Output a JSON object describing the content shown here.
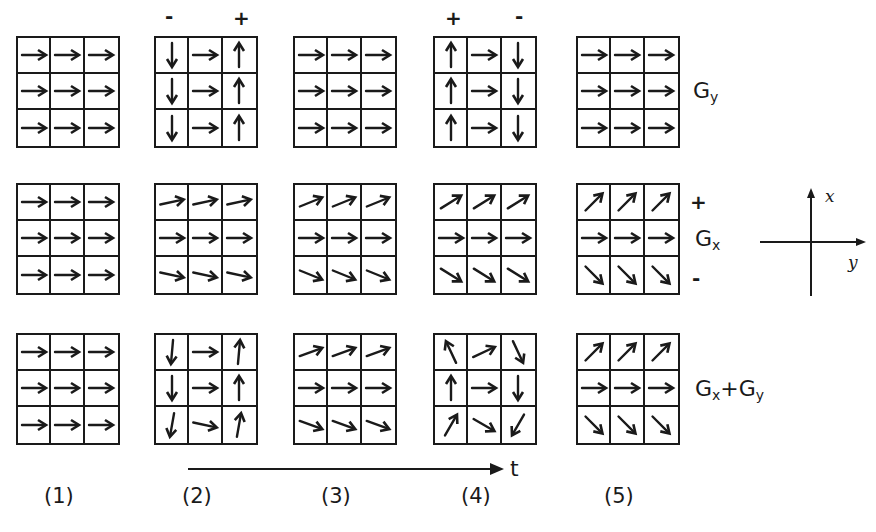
{
  "figure": {
    "columns": [
      {
        "id": 1,
        "label": "(1)",
        "x": 16
      },
      {
        "id": 2,
        "label": "(2)",
        "x": 154
      },
      {
        "id": 3,
        "label": "(3)",
        "x": 293
      },
      {
        "id": 4,
        "label": "(4)",
        "x": 433
      },
      {
        "id": 5,
        "label": "(5)",
        "x": 576
      }
    ],
    "rows": [
      {
        "name": "Gy",
        "label_main": "G",
        "label_sub": "y",
        "y": 36,
        "grids": [
          [
            0,
            0,
            0,
            0,
            0,
            0,
            0,
            0,
            0
          ],
          [
            -90,
            0,
            90,
            -90,
            0,
            90,
            -90,
            0,
            90
          ],
          [
            0,
            0,
            0,
            0,
            0,
            0,
            0,
            0,
            0
          ],
          [
            90,
            0,
            -90,
            90,
            0,
            -90,
            90,
            0,
            -90
          ],
          [
            0,
            0,
            0,
            0,
            0,
            0,
            0,
            0,
            0
          ]
        ]
      },
      {
        "name": "Gx",
        "label_main": "G",
        "label_sub": "x",
        "y": 183,
        "plus_sign": "+",
        "minus_sign": "-",
        "grids": [
          [
            0,
            0,
            0,
            0,
            0,
            0,
            0,
            0,
            0
          ],
          [
            12,
            12,
            12,
            0,
            0,
            0,
            -12,
            -12,
            -12
          ],
          [
            22,
            22,
            22,
            0,
            0,
            0,
            -22,
            -22,
            -22
          ],
          [
            32,
            32,
            32,
            0,
            0,
            0,
            -32,
            -32,
            -32
          ],
          [
            45,
            45,
            45,
            0,
            0,
            0,
            -45,
            -45,
            -45
          ]
        ]
      },
      {
        "name": "Gx+Gy",
        "label_main": "G",
        "label_sub": "x",
        "label_plus": "+",
        "label_main2": "G",
        "label_sub2": "y",
        "y": 333,
        "grids": [
          [
            0,
            0,
            0,
            0,
            0,
            0,
            0,
            0,
            0
          ],
          [
            -95,
            0,
            85,
            -90,
            0,
            90,
            -100,
            -12,
            80
          ],
          [
            20,
            20,
            20,
            0,
            0,
            0,
            -20,
            -20,
            -20
          ],
          [
            115,
            25,
            -65,
            90,
            0,
            -90,
            60,
            -30,
            -120
          ],
          [
            45,
            45,
            45,
            0,
            0,
            0,
            -45,
            -45,
            -45
          ]
        ]
      }
    ],
    "top_signs": [
      {
        "column": 2,
        "left": "-",
        "right": "+"
      },
      {
        "column": 4,
        "left": "+",
        "right": "-"
      }
    ],
    "time_axis": {
      "label": "t"
    },
    "coordinate_axes": {
      "vertical_label": "x",
      "horizontal_label": "y"
    }
  }
}
